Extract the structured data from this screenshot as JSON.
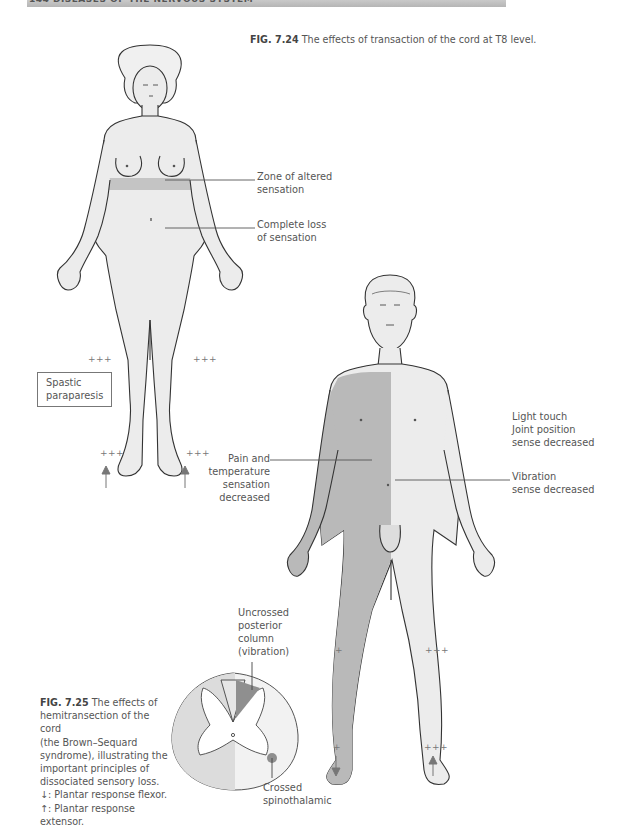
{
  "page_header": {
    "text": "144  DISEASES OF THE NERVOUS SYSTEM"
  },
  "figure_7_24": {
    "number": "FIG. 7.24",
    "caption": "The effects of transaction of the cord at T8 level.",
    "labels": {
      "zone_altered": [
        "Zone of altered",
        "sensation"
      ],
      "complete_loss": [
        "Complete loss",
        "of sensation"
      ],
      "spastic": [
        "Spastic",
        "paraparesis"
      ]
    },
    "reflex_marks": {
      "knee_left": "+++",
      "knee_right": "+++",
      "ankle_left": "+++",
      "ankle_right": "+++"
    },
    "plantar_left": "↑",
    "plantar_right": "↑"
  },
  "figure_7_25": {
    "number": "FIG. 7.25",
    "caption_lines": [
      "The effects of",
      "hemitransection of the cord",
      "(the Brown–Sequard",
      "syndrome), illustrating the",
      "important principles of",
      "dissociated sensory loss.",
      "↓: Plantar response flexor.",
      "↑: Plantar response extensor."
    ],
    "labels": {
      "pain_temp": [
        "Pain and",
        "temperature",
        "sensation",
        "decreased"
      ],
      "light_touch": [
        "Light touch",
        "Joint position",
        "sense decreased"
      ],
      "vibration": [
        "Vibration",
        "sense decreased"
      ],
      "uncrossed": [
        "Uncrossed",
        "posterior",
        "column",
        "(vibration)"
      ],
      "crossed": [
        "Crossed",
        "spinothalamic"
      ]
    },
    "reflex_marks": {
      "knee_left": "+",
      "knee_right": "+++",
      "ankle_left": "+",
      "ankle_right": "+++"
    },
    "plantar_left": "↓",
    "plantar_right": "↑"
  },
  "colors": {
    "skin": "#ececec",
    "affected": "#b9b9b9",
    "band": "#c4c4c4",
    "outline": "#333333",
    "cord_dark": "#8f8f8f"
  }
}
